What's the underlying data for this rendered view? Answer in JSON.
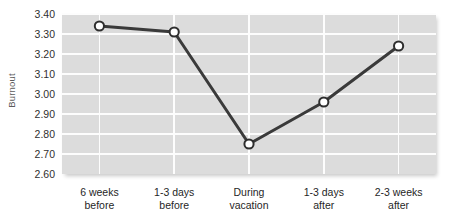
{
  "chart_data": {
    "type": "line",
    "title": "",
    "subtitle": "",
    "xlabel": "",
    "ylabel": "Burnout",
    "categories": [
      "6 weeks\nbefore",
      "1-3 days\nbefore",
      "During\nvacation",
      "1-3 days\nafter",
      "2-3 weeks\nafter"
    ],
    "category_lines": [
      [
        "6 weeks",
        "before"
      ],
      [
        "1-3 days",
        "before"
      ],
      [
        "During",
        "vacation"
      ],
      [
        "1-3 days",
        "after"
      ],
      [
        "2-3 weeks",
        "after"
      ]
    ],
    "values": [
      3.34,
      3.31,
      2.75,
      2.96,
      3.24
    ],
    "ylim": [
      2.6,
      3.4
    ],
    "ytick_step": 0.1,
    "ytick_labels": [
      "3.40",
      "3.30",
      "3.20",
      "3.10",
      "3.00",
      "2.90",
      "2.80",
      "2.70",
      "2.60"
    ],
    "ytick_values": [
      3.4,
      3.3,
      3.2,
      3.1,
      3.0,
      2.9,
      2.8,
      2.7,
      2.6
    ],
    "grid": true,
    "grid_orientation": "both",
    "legend": false,
    "legend_position": "none",
    "marker": "circle-open",
    "series": [
      {
        "name": "Burnout",
        "values": [
          3.34,
          3.31,
          2.75,
          2.96,
          3.24
        ]
      }
    ],
    "colors": {
      "plot_background": "#dcdcdc",
      "gridline": "#fdfdfd",
      "line": "#3a3a3a",
      "marker_fill": "#ffffff",
      "marker_stroke": "#2e2e2e",
      "tick_text": "#2f2f2f",
      "axis_title_text": "#5b5b5b",
      "page_background": "#ffffff"
    }
  }
}
